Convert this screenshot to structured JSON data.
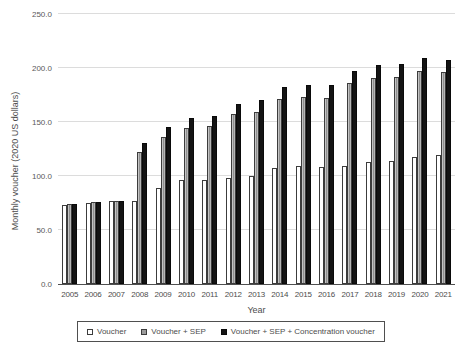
{
  "chart_data": {
    "type": "bar",
    "title": "",
    "xlabel": "Year",
    "ylabel": "Monthly voucher (2020 US dollars)",
    "ylim": [
      0,
      250
    ],
    "ytick_step": 50,
    "ytick_labels": [
      "0.0",
      "50.0",
      "100.0",
      "150.0",
      "200.0",
      "250.0"
    ],
    "grid": true,
    "legend_position": "bottom",
    "categories": [
      "2005",
      "2006",
      "2007",
      "2008",
      "2009",
      "2010",
      "2011",
      "2012",
      "2013",
      "2014",
      "2015",
      "2016",
      "2017",
      "2018",
      "2019",
      "2020",
      "2021"
    ],
    "series": [
      {
        "name": "Voucher",
        "color": "#ffffff",
        "values": [
          73,
          75,
          77,
          77,
          89,
          96,
          96,
          98,
          100,
          107,
          109,
          108,
          109,
          113,
          114,
          118,
          119
        ]
      },
      {
        "name": "Voucher + SEP",
        "color": "#9b9b9b",
        "values": [
          74,
          76,
          77,
          122,
          136,
          144,
          146,
          157,
          159,
          171,
          173,
          172,
          186,
          191,
          192,
          197,
          196
        ]
      },
      {
        "name": "Voucher + SEP + Concentration voucher",
        "color": "#141414",
        "values": [
          74,
          76,
          77,
          131,
          145,
          154,
          156,
          167,
          170,
          182,
          184,
          184,
          197,
          203,
          204,
          209,
          207
        ]
      }
    ],
    "colors": {
      "gridline": "#dcdcdc",
      "axis": "#4f4f4f",
      "text": "#4d4d4d"
    }
  }
}
